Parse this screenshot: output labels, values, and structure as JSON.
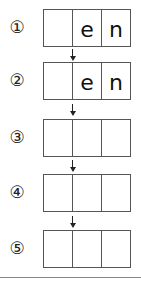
{
  "steps": [
    {
      "label": "①",
      "cells": [
        "",
        "e",
        "n"
      ]
    },
    {
      "label": "②",
      "cells": [
        "",
        "e",
        "n"
      ]
    },
    {
      "label": "③",
      "cells": [
        "",
        "",
        ""
      ]
    },
    {
      "label": "④",
      "cells": [
        "",
        "",
        ""
      ]
    },
    {
      "label": "⑤",
      "cells": [
        "",
        "",
        ""
      ]
    }
  ],
  "arrow_icon": "down-arrow-icon"
}
